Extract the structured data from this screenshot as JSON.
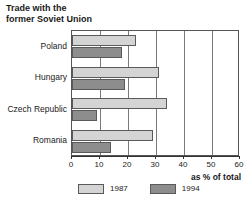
{
  "chart_data": {
    "type": "bar",
    "orientation": "horizontal",
    "title": "Trade with the\nformer Soviet Union",
    "xlabel": "as % of total",
    "ylabel": "",
    "xlim": [
      0,
      60
    ],
    "xticks": [
      0,
      10,
      20,
      30,
      40,
      50,
      60
    ],
    "xtick_labels": [
      "0",
      "10",
      "20",
      "30",
      "40",
      "50",
      "60"
    ],
    "grid": true,
    "legend_position": "bottom-left",
    "categories": [
      "Poland",
      "Hungary",
      "Czech Republic",
      "Romania"
    ],
    "series": [
      {
        "name": "1987",
        "color": "#d4d4d4",
        "values": [
          23,
          31,
          34,
          29
        ]
      },
      {
        "name": "1994",
        "color": "#8d8d8d",
        "values": [
          18,
          19,
          9,
          14
        ]
      }
    ]
  }
}
